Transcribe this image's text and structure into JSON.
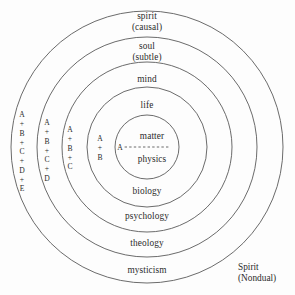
{
  "figure": {
    "center": {
      "x": 147,
      "y": 147
    },
    "background_color": "#fdfdfd",
    "stroke_color": "#5a5a5a"
  },
  "rings": [
    {
      "name": "mysticism-ring",
      "radius": 136,
      "top_label": "spirit",
      "top_sublabel": "(causal)",
      "bottom_label": "mysticism"
    },
    {
      "name": "theology-ring",
      "radius": 110,
      "top_label": "soul",
      "top_sublabel": "(subtle)",
      "bottom_label": "theology"
    },
    {
      "name": "psychology-ring",
      "radius": 85,
      "top_label": "mind",
      "top_sublabel": "",
      "bottom_label": "psychology"
    },
    {
      "name": "biology-ring",
      "radius": 60,
      "top_label": "life",
      "top_sublabel": "",
      "bottom_label": "biology"
    },
    {
      "name": "physics-ring",
      "radius": 32,
      "top_label": "matter",
      "top_sublabel": "",
      "bottom_label": "physics"
    }
  ],
  "top_labels": [
    {
      "text": "spirit",
      "sub": "(causal)",
      "x": 147,
      "y": 22
    },
    {
      "text": "soul",
      "sub": "(subtle)",
      "x": 147,
      "y": 52
    },
    {
      "text": "mind",
      "sub": "",
      "x": 147,
      "y": 79
    },
    {
      "text": "life",
      "sub": "",
      "x": 147,
      "y": 105
    },
    {
      "text": "matter",
      "sub": "",
      "x": 152,
      "y": 136
    }
  ],
  "bottom_labels": [
    {
      "text": "physics",
      "x": 152,
      "y": 159
    },
    {
      "text": "biology",
      "x": 147,
      "y": 191
    },
    {
      "text": "psychology",
      "x": 147,
      "y": 216
    },
    {
      "text": "theology",
      "x": 147,
      "y": 243
    },
    {
      "text": "mysticism",
      "x": 147,
      "y": 270
    }
  ],
  "nested_set_labels": [
    {
      "name": "set-abcde",
      "letters": [
        "A",
        "+",
        "B",
        "+",
        "C",
        "+",
        "D",
        "+",
        "E"
      ],
      "x": 22,
      "y": 152
    },
    {
      "name": "set-abcd",
      "letters": [
        "A",
        "+",
        "B",
        "+",
        "C",
        "+",
        "D"
      ],
      "x": 47,
      "y": 150
    },
    {
      "name": "set-abc",
      "letters": [
        "A",
        "+",
        "B",
        "+",
        "C"
      ],
      "x": 70,
      "y": 148
    },
    {
      "name": "set-ab",
      "letters": [
        "A",
        "+",
        "B"
      ],
      "x": 100,
      "y": 148
    },
    {
      "name": "set-a",
      "letters": [
        "A"
      ],
      "x": 120,
      "y": 148
    }
  ],
  "corner_note": {
    "line1": "Spirit",
    "line2": "(Nondual)",
    "x": 238,
    "y": 262
  }
}
